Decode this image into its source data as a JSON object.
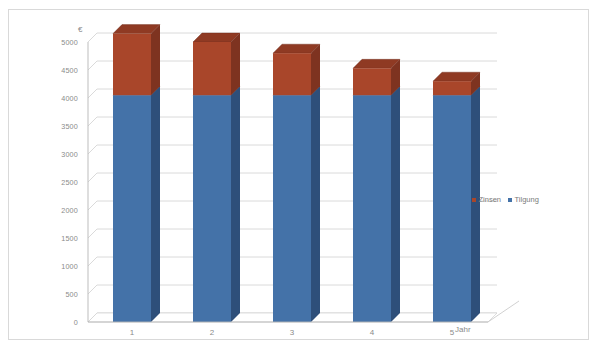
{
  "chart_data": {
    "type": "bar",
    "subtype": "stacked-column-3d",
    "title": "",
    "xlabel": "Jahr",
    "ylabel": "€",
    "categories": [
      "1",
      "2",
      "3",
      "4",
      "5"
    ],
    "series": [
      {
        "name": "Tilgung",
        "color": "#4472a8",
        "values": [
          4050,
          4050,
          4050,
          4050,
          4050
        ]
      },
      {
        "name": "Zinsen",
        "color": "#a9462a",
        "values": [
          1100,
          950,
          750,
          480,
          250
        ]
      }
    ],
    "stack_totals": [
      5150,
      5000,
      4800,
      4530,
      4300
    ],
    "ylim": [
      0,
      5000
    ],
    "ytick_step": 500,
    "ytick_labels": [
      "5000",
      "4500",
      "4000",
      "3500",
      "3000",
      "2500",
      "2000",
      "1500",
      "1000",
      "500",
      "0"
    ],
    "grid": true,
    "legend_position": "right-middle",
    "legend": [
      {
        "label": "Zinsen",
        "color": "#a9462a"
      },
      {
        "label": "Tilgung",
        "color": "#4472a8"
      }
    ]
  },
  "axes": {
    "y_unit_symbol": "€",
    "x_axis_title": "Jahr"
  },
  "colors": {
    "zinsen_front": "#a9462a",
    "zinsen_side": "#7e3320",
    "zinsen_top": "#8f3a23",
    "tilgung_front": "#4472a8",
    "tilgung_side": "#2e4f7a",
    "gridline": "#d0d0d0",
    "frame": "#d9d9d9",
    "text": "#8a8a8a",
    "background": "#ffffff"
  }
}
